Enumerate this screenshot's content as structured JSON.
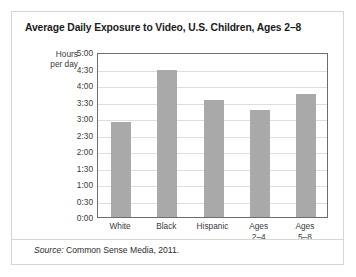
{
  "chart_data": {
    "type": "bar",
    "title": "Average Daily Exposure to Video, U.S. Children, Ages 2–8",
    "ylabel_line1": "Hours",
    "ylabel_line2": "per day",
    "xlabel": "",
    "categories": [
      "White",
      "Black",
      "Hispanic",
      "Ages 2–4",
      "Ages 5–8"
    ],
    "category_lines": [
      [
        "White"
      ],
      [
        "Black"
      ],
      [
        "Hispanic"
      ],
      [
        "Ages",
        "2–4"
      ],
      [
        "Ages",
        "5–8"
      ]
    ],
    "values": [
      2.87,
      4.45,
      3.55,
      3.23,
      3.72
    ],
    "value_labels": [
      "2:52",
      "4:27",
      "3:33",
      "3:14",
      "3:43"
    ],
    "ylim": [
      0,
      5
    ],
    "ytick_values": [
      5.0,
      4.5,
      4.0,
      3.5,
      3.0,
      2.5,
      2.0,
      1.5,
      1.0,
      0.5,
      0.0
    ],
    "ytick_labels": [
      "5:00",
      "4:30",
      "4:00",
      "3:30",
      "3:00",
      "2:30",
      "2:00",
      "1:30",
      "1:00",
      "0:30",
      "0:00"
    ],
    "grid": true,
    "legend": "none",
    "bar_color": "#a9a9a9",
    "gridline_color": "#dedede",
    "axis_color": "#6d6d6d"
  },
  "source": {
    "label": "Source:",
    "text": " Common Sense Media, 2011."
  }
}
